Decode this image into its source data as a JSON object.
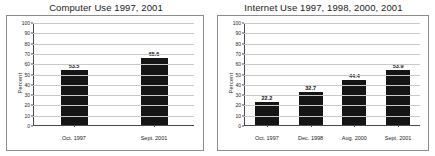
{
  "charts": [
    {
      "panel_name": "computer-use-chart",
      "chart_data": {
        "type": "bar",
        "title": "Computer Use 1997, 2001",
        "xlabel": "",
        "ylabel": "Percent",
        "ylim": [
          0,
          100
        ],
        "ytick_step": 10,
        "yticks": [
          "100",
          "90",
          "80",
          "70",
          "60",
          "50",
          "40",
          "30",
          "20",
          "10",
          "0"
        ],
        "grid": true,
        "legend": "none",
        "categories": [
          "Oct. 1997",
          "Sept. 2001"
        ],
        "values": [
          53.5,
          65.6
        ],
        "value_labels": [
          "53.5",
          "65.6"
        ],
        "bar_color": "#151515"
      }
    },
    {
      "panel_name": "internet-use-chart",
      "chart_data": {
        "type": "bar",
        "title": "Internet Use 1997, 1998, 2000, 2001",
        "xlabel": "",
        "ylabel": "Percent",
        "ylim": [
          0,
          100
        ],
        "ytick_step": 10,
        "yticks": [
          "100",
          "90",
          "80",
          "70",
          "60",
          "50",
          "40",
          "30",
          "20",
          "10",
          "0"
        ],
        "grid": true,
        "legend": "none",
        "categories": [
          "Oct. 1997",
          "Dec. 1998",
          "Aug. 2000",
          "Sept. 2001"
        ],
        "values": [
          22.2,
          32.7,
          44.4,
          53.9
        ],
        "value_labels": [
          "22.2",
          "32.7",
          "44.4",
          "53.9"
        ],
        "bar_color": "#151515"
      }
    }
  ]
}
